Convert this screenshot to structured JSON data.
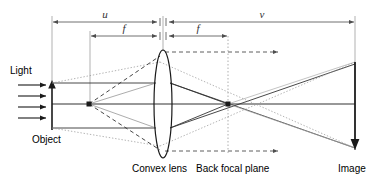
{
  "diagram": {
    "labels": {
      "light": "Light",
      "object": "Object",
      "convex_lens": "Convex lens",
      "back_focal_plane": "Back focal plane",
      "image": "Image",
      "u": "u",
      "f1": "f",
      "f2": "f",
      "v": "v"
    },
    "colors": {
      "stroke": "#1a1a1a",
      "dim": "#4d4d4d",
      "faint": "#9a9a9a",
      "background": "#ffffff"
    },
    "geometry": {
      "optical_axis_y": 104,
      "object_plane_x": 52,
      "object_point_x": 89,
      "lens_center_x": 163,
      "lens_rx": 9,
      "lens_ry": 54,
      "front_focal_x": 90,
      "back_focal_plane_x": 228,
      "image_plane_x": 355,
      "object_top_y": 82,
      "image_bottom_y": 148,
      "image_top_y": 62,
      "dashed_top_y": 52,
      "dashed_bottom_y": 151,
      "dashed_arrow_end_x": 280
    },
    "dimensions": [
      {
        "name": "u",
        "label": "u",
        "x1": 52,
        "x2": 158,
        "y": 22
      },
      {
        "name": "f-front",
        "label": "f",
        "x1": 90,
        "x2": 158,
        "y": 36
      },
      {
        "name": "f-back",
        "label": "f",
        "x1": 168,
        "x2": 228,
        "y": 36
      },
      {
        "name": "v",
        "label": "v",
        "x1": 168,
        "x2": 355,
        "y": 22
      }
    ],
    "light_arrows": [
      {
        "y": 85
      },
      {
        "y": 96
      },
      {
        "y": 107
      },
      {
        "y": 118
      }
    ]
  }
}
